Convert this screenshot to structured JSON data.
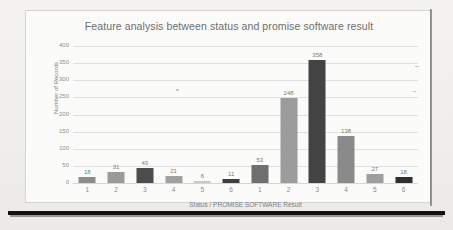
{
  "chart_data": {
    "type": "bar",
    "title": "Feature analysis between status and promise software result",
    "xlabel": "Status / PROMISE SOFTWARE  Result",
    "ylabel": "Number of Records",
    "categories": [
      "1",
      "2",
      "3",
      "4",
      "5",
      "6",
      "1",
      "2",
      "3",
      "4",
      "5",
      "6"
    ],
    "values": [
      18,
      31,
      43,
      21,
      6,
      11,
      53,
      248,
      358,
      138,
      27,
      18
    ],
    "bar_colors": [
      "#8c8c8c",
      "#9a9a9a",
      "#4d4d4d",
      "#a0a0a0",
      "#c9c9c9",
      "#3f3f3f",
      "#6f6f6f",
      "#9c9c9c",
      "#434343",
      "#8a8a8a",
      "#9e9e9e",
      "#2f2f2f"
    ],
    "ylim": [
      0,
      400
    ],
    "yticks": [
      0,
      50,
      100,
      150,
      200,
      250,
      300,
      350,
      400
    ],
    "grid": true,
    "legend": "none"
  },
  "page": {
    "title_color": "#6d6d6d",
    "grid_color": "#e2e0de",
    "rule_color": "#121212"
  }
}
